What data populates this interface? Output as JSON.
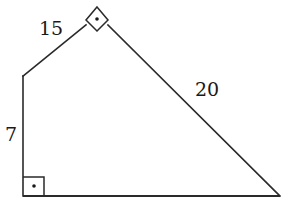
{
  "figure": {
    "type": "pentagon-like polygon with two right angles",
    "partial_label": ")",
    "sides": [
      {
        "id": "left-vertical",
        "label": "7"
      },
      {
        "id": "upper-left",
        "label": "15"
      },
      {
        "id": "upper-right",
        "label": "20"
      },
      {
        "id": "bottom",
        "label": ""
      }
    ],
    "right_angles": [
      {
        "id": "top-vertex",
        "marker": "square-with-dot"
      },
      {
        "id": "bottom-left-vertex",
        "marker": "square-with-dot"
      }
    ],
    "labels": {
      "side_15": "15",
      "side_20": "20",
      "side_7": "7"
    },
    "colors": {
      "stroke": "#2a2a2a",
      "background": "#ffffff"
    }
  }
}
